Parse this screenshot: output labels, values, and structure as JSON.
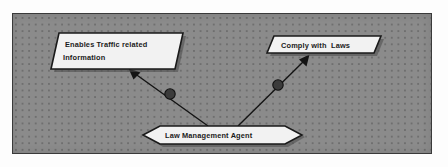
{
  "diagram": {
    "type": "agent-goal-diagram",
    "canvas": {
      "background_color": "#8b8b8b",
      "grid": "dotted",
      "border_color": "#3a3a3a"
    },
    "nodes": [
      {
        "id": "enables-traffic-related-information",
        "shape": "parallelogram",
        "role": "softgoal",
        "label_line_1": "Enables Traffic related",
        "label_line_2": "Information",
        "fill_color": "#f2f2f2",
        "stroke_color": "#1a1a1a"
      },
      {
        "id": "comply-with-laws",
        "shape": "parallelogram",
        "role": "softgoal",
        "label_line_1": "Comply with  Laws",
        "label_line_2": "",
        "fill_color": "#f2f2f2",
        "stroke_color": "#1a1a1a"
      },
      {
        "id": "law-management-agent",
        "shape": "hexagon",
        "role": "agent",
        "label_line_1": "Law Management Agent",
        "label_line_2": "",
        "fill_color": "#f2f2f2",
        "stroke_color": "#1a1a1a"
      }
    ],
    "edges": [
      {
        "id": "agent-to-traffic-info",
        "from": "law-management-agent",
        "to": "enables-traffic-related-information",
        "arrow": "open-arrowhead",
        "decorator": "filled-circle",
        "color": "#141414"
      },
      {
        "id": "agent-to-comply-laws",
        "from": "law-management-agent",
        "to": "comply-with-laws",
        "arrow": "open-arrowhead",
        "decorator": "filled-circle",
        "color": "#141414"
      }
    ]
  }
}
